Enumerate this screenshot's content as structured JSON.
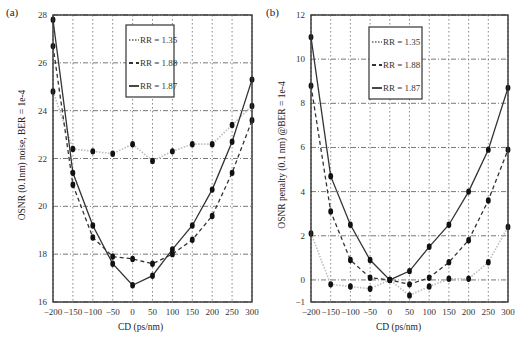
{
  "chart_data": [
    {
      "id": "a",
      "type": "line",
      "panel_label": "(a)",
      "title": "",
      "xlabel": "CD (ps/nm)",
      "ylabel": "OSNR (0.1nm) noise, BER = 1e-4",
      "x": [
        -200,
        -150,
        -100,
        -50,
        0,
        50,
        100,
        150,
        200,
        250,
        300
      ],
      "xlim": [
        -200,
        300
      ],
      "ylim": [
        16,
        28
      ],
      "xticks": [
        -200,
        -150,
        -100,
        -50,
        0,
        50,
        100,
        150,
        200,
        250,
        300
      ],
      "yticks": [
        16,
        18,
        20,
        22,
        24,
        26,
        28
      ],
      "grid": true,
      "legend_position": "upper center",
      "series": [
        {
          "name": "RR = 1.35",
          "style": "dotted",
          "color": "#bdbdbd",
          "values": [
            24.8,
            22.4,
            22.3,
            22.2,
            22.6,
            21.9,
            22.3,
            22.6,
            22.6,
            23.4,
            24.2
          ]
        },
        {
          "name": "RR = 1.88",
          "style": "dashed",
          "color": "#333333",
          "values": [
            26.7,
            20.9,
            18.7,
            17.9,
            17.8,
            17.6,
            18.0,
            18.6,
            19.6,
            21.4,
            23.6
          ]
        },
        {
          "name": "RR = 1.87",
          "style": "solid",
          "color": "#333333",
          "values": [
            27.8,
            21.4,
            19.2,
            17.6,
            16.7,
            17.1,
            18.2,
            19.2,
            20.7,
            22.7,
            25.3
          ]
        }
      ]
    },
    {
      "id": "b",
      "type": "line",
      "panel_label": "(b)",
      "title": "",
      "xlabel": "CD (ps/nm)",
      "ylabel": "OSNR penalty (0.1 nm) @BER = 1e-4",
      "x": [
        -200,
        -150,
        -100,
        -50,
        0,
        50,
        100,
        150,
        200,
        250,
        300
      ],
      "xlim": [
        -200,
        300
      ],
      "ylim": [
        -1,
        12
      ],
      "xticks": [
        -200,
        -150,
        -100,
        -50,
        0,
        50,
        100,
        150,
        200,
        250,
        300
      ],
      "yticks": [
        -1,
        0,
        2,
        4,
        6,
        8,
        10,
        12
      ],
      "grid": true,
      "legend_position": "upper center",
      "series": [
        {
          "name": "RR = 1.35",
          "style": "dotted",
          "color": "#bdbdbd",
          "values": [
            2.1,
            -0.2,
            -0.3,
            -0.4,
            0.0,
            -0.7,
            -0.3,
            0.05,
            0.05,
            0.8,
            2.4
          ]
        },
        {
          "name": "RR = 1.88",
          "style": "dashed",
          "color": "#333333",
          "values": [
            8.8,
            3.1,
            0.9,
            0.1,
            0.0,
            -0.2,
            0.1,
            0.8,
            1.8,
            3.6,
            5.9
          ]
        },
        {
          "name": "RR = 1.87",
          "style": "solid",
          "color": "#333333",
          "values": [
            11.0,
            4.7,
            2.5,
            0.9,
            0.0,
            0.4,
            1.5,
            2.5,
            4.0,
            5.9,
            8.7
          ]
        }
      ]
    }
  ],
  "layout": {
    "plots": [
      {
        "left": 53,
        "top": 15,
        "right": 252,
        "bottom": 302
      },
      {
        "left": 47,
        "top": 15,
        "right": 244,
        "bottom": 302
      }
    ],
    "legend": [
      {
        "x": 126,
        "y": 25,
        "w": 48,
        "h": 72
      },
      {
        "x": 105,
        "y": 27,
        "w": 53,
        "h": 72
      }
    ]
  }
}
